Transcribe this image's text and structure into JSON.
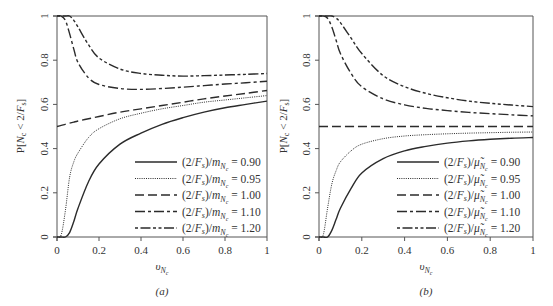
{
  "chart_data": [
    {
      "panel": "a",
      "type": "line",
      "caption": "(a)",
      "xlabel": "υ_{N_c}",
      "ylabel": "P[N_c < 2/F_s]",
      "xlim": [
        0,
        1
      ],
      "ylim": [
        0,
        1
      ],
      "xticks": [
        "0",
        "0.2",
        "0.4",
        "0.6",
        "0.8",
        "1"
      ],
      "yticks": [
        "0",
        "0.2",
        "0.4",
        "0.6",
        "0.8",
        "1"
      ],
      "grid": false,
      "legend_position": "lower right",
      "x": [
        0,
        0.02,
        0.04,
        0.06,
        0.08,
        0.1,
        0.15,
        0.2,
        0.3,
        0.4,
        0.5,
        0.6,
        0.7,
        0.8,
        0.9,
        1.0
      ],
      "series": [
        {
          "name": "(2/F_s)/m_{N_c} = 0.90",
          "style": "solid",
          "values": [
            0,
            0,
            0.0,
            0.02,
            0.07,
            0.13,
            0.25,
            0.33,
            0.42,
            0.47,
            0.51,
            0.54,
            0.565,
            0.585,
            0.6,
            0.615
          ]
        },
        {
          "name": "(2/F_s)/m_{N_c} = 0.95",
          "style": "dotted",
          "values": [
            0,
            0.01,
            0.12,
            0.27,
            0.34,
            0.38,
            0.45,
            0.49,
            0.535,
            0.56,
            0.58,
            0.595,
            0.61,
            0.62,
            0.63,
            0.64
          ]
        },
        {
          "name": "(2/F_s)/m_{N_c} = 1.00",
          "style": "dashed",
          "values": [
            0.5,
            0.505,
            0.51,
            0.515,
            0.52,
            0.525,
            0.535,
            0.545,
            0.565,
            0.58,
            0.595,
            0.61,
            0.625,
            0.638,
            0.65,
            0.663
          ]
        },
        {
          "name": "(2/F_s)/m_{N_c} = 1.10",
          "style": "dashdot",
          "values": [
            1,
            1,
            0.98,
            0.92,
            0.85,
            0.79,
            0.72,
            0.69,
            0.672,
            0.668,
            0.672,
            0.678,
            0.685,
            0.692,
            0.698,
            0.705
          ]
        },
        {
          "name": "(2/F_s)/m_{N_c} = 1.20",
          "style": "dashdotdot",
          "values": [
            1,
            1,
            1,
            1,
            0.98,
            0.95,
            0.87,
            0.81,
            0.76,
            0.74,
            0.732,
            0.728,
            0.73,
            0.733,
            0.736,
            0.74
          ]
        }
      ]
    },
    {
      "panel": "b",
      "type": "line",
      "caption": "(b)",
      "xlabel": "υ_{N_c}",
      "ylabel": "P[N_c < 2/F_s]",
      "xlim": [
        0,
        1
      ],
      "ylim": [
        0,
        1
      ],
      "xticks": [
        "0",
        "0.2",
        "0.4",
        "0.6",
        "0.8",
        "1"
      ],
      "yticks": [
        "0",
        "0.2",
        "0.4",
        "0.6",
        "0.8",
        "1"
      ],
      "grid": false,
      "legend_position": "lower right",
      "x": [
        0,
        0.02,
        0.04,
        0.06,
        0.08,
        0.1,
        0.15,
        0.2,
        0.3,
        0.4,
        0.5,
        0.6,
        0.7,
        0.8,
        0.9,
        1.0
      ],
      "series": [
        {
          "name": "(2/F_s)/μ̃_{N_c} = 0.90",
          "style": "solid",
          "values": [
            0,
            0,
            0.0,
            0.03,
            0.08,
            0.13,
            0.22,
            0.29,
            0.355,
            0.39,
            0.41,
            0.425,
            0.435,
            0.442,
            0.447,
            0.45
          ]
        },
        {
          "name": "(2/F_s)/μ̃_{N_c} = 0.95",
          "style": "dotted",
          "values": [
            0,
            0.01,
            0.13,
            0.24,
            0.3,
            0.34,
            0.39,
            0.42,
            0.445,
            0.457,
            0.463,
            0.467,
            0.47,
            0.472,
            0.474,
            0.475
          ]
        },
        {
          "name": "(2/F_s)/μ̃_{N_c} = 1.00",
          "style": "dashed",
          "values": [
            0.5,
            0.5,
            0.5,
            0.5,
            0.5,
            0.5,
            0.5,
            0.5,
            0.5,
            0.5,
            0.5,
            0.5,
            0.5,
            0.5,
            0.5,
            0.5
          ]
        },
        {
          "name": "(2/F_s)/μ̃_{N_c} = 1.10",
          "style": "dashdot",
          "values": [
            1,
            1,
            0.99,
            0.95,
            0.89,
            0.83,
            0.74,
            0.68,
            0.625,
            0.598,
            0.582,
            0.572,
            0.564,
            0.558,
            0.553,
            0.548
          ]
        },
        {
          "name": "(2/F_s)/μ̃_{N_c} = 1.20",
          "style": "dashdotdot",
          "values": [
            1,
            1,
            1,
            1,
            0.99,
            0.97,
            0.9,
            0.83,
            0.73,
            0.68,
            0.65,
            0.63,
            0.615,
            0.605,
            0.597,
            0.59
          ]
        }
      ]
    }
  ],
  "panels": [
    {
      "caption": "(a)",
      "ylabel": "P[N_c < 2/F_s]",
      "xlabel_main": "υ",
      "xlabel_sub": "N",
      "xlabel_subsub": "c",
      "legend": [
        {
          "pre": "(2/F",
          "s": "s",
          "mid": ")/m",
          "sub": "N",
          "subsub": "c",
          "val": "= 0.90"
        },
        {
          "pre": "(2/F",
          "s": "s",
          "mid": ")/m",
          "sub": "N",
          "subsub": "c",
          "val": "= 0.95"
        },
        {
          "pre": "(2/F",
          "s": "s",
          "mid": ")/m",
          "sub": "N",
          "subsub": "c",
          "val": "= 1.00"
        },
        {
          "pre": "(2/F",
          "s": "s",
          "mid": ")/m",
          "sub": "N",
          "subsub": "c",
          "val": "= 1.10"
        },
        {
          "pre": "(2/F",
          "s": "s",
          "mid": ")/m",
          "sub": "N",
          "subsub": "c",
          "val": "= 1.20"
        }
      ]
    },
    {
      "caption": "(b)",
      "ylabel": "P[N_c < 2/F_s]",
      "xlabel_main": "υ",
      "xlabel_sub": "N",
      "xlabel_subsub": "c",
      "legend": [
        {
          "pre": "(2/F",
          "s": "s",
          "mid": ")/μ̃",
          "sub": "N",
          "subsub": "c",
          "val": "= 0.90"
        },
        {
          "pre": "(2/F",
          "s": "s",
          "mid": ")/μ̃",
          "sub": "N",
          "subsub": "c",
          "val": "= 0.95"
        },
        {
          "pre": "(2/F",
          "s": "s",
          "mid": ")/μ̃",
          "sub": "N",
          "subsub": "c",
          "val": "= 1.00"
        },
        {
          "pre": "(2/F",
          "s": "s",
          "mid": ")/μ̃",
          "sub": "N",
          "subsub": "c",
          "val": "= 1.10"
        },
        {
          "pre": "(2/F",
          "s": "s",
          "mid": ")/μ̃",
          "sub": "N",
          "subsub": "c",
          "val": "= 1.20"
        }
      ]
    }
  ],
  "colors": {
    "line": "#2b2b2b",
    "axis": "#555555",
    "text": "#333333"
  }
}
